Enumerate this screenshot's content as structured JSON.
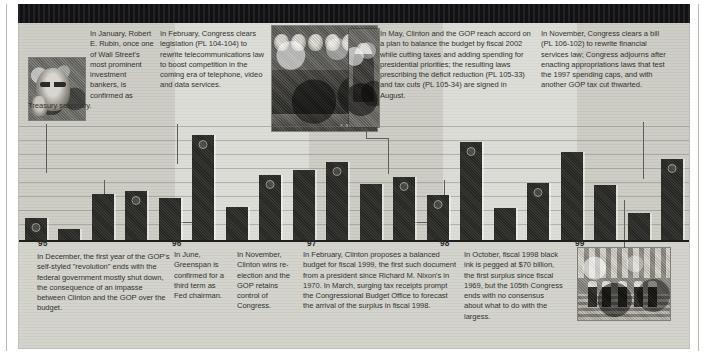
{
  "meta": {
    "accent_dark": "#2a2a27",
    "paper": "#cdcdc6",
    "ink": "#33332f"
  },
  "photos": {
    "rubin": {
      "name": "robert-rubin-portrait"
    },
    "signing": {
      "name": "congress-bill-signing-photo",
      "credit": "R. Michael Jenkins"
    },
    "clinton": {
      "name": "clinton-at-desk-photo"
    },
    "steps": {
      "name": "capitol-steps-crowd-photo"
    }
  },
  "top_callouts": [
    {
      "id": "jan-1995-rubin",
      "text": "In January, Robert E. Rubin, once one of Wall Street's most prominent investment bankers, is confirmed as Treasury secretary."
    },
    {
      "id": "feb-1996-telecom",
      "text": "In February, Congress clears legislation (PL 104-104) to rewrite telecommunications law to boost competition in the coming era of telephone, video and data services."
    },
    {
      "id": "may-1997-balanced-budget",
      "text": "In May, Clinton and the GOP reach accord on a plan to balance the budget by fiscal 2002 while cutting taxes and adding spending for presidential priorities; the resulting laws prescribing the deficit reduction (PL 105-33) and tax cuts (PL 105-34) are signed in August."
    },
    {
      "id": "nov-1999-financial-services",
      "text": "In November, Congress clears a bill (PL 106-102) to rewrite financial services law; Congress adjourns after enacting appropriations laws that test the 1997 spending caps, and with another GOP tax cut thwarted."
    }
  ],
  "bottom_callouts": [
    {
      "id": "dec-1995-shutdown",
      "text": "In December, the first year of the GOP's self-styled \"revolution\" ends with the federal government mostly shut down, the consequence of an impasse between Clinton and the GOP over the budget."
    },
    {
      "id": "jun-1996-greenspan",
      "text": "In June, Greenspan is confirmed for a third term as Fed chairman."
    },
    {
      "id": "nov-1996-reelection",
      "text": "In November, Clinton wins re-election and the GOP retains control of Congress."
    },
    {
      "id": "feb-1998-balanced-budget-proposal",
      "text": "In February, Clinton proposes a balanced budget for fiscal 1999, the first such document from a president since Richard M. Nixon's in 1970. In March, surging tax receipts prompt the Congressional Budget Office to forecast the arrival of the surplus in fiscal 1998."
    },
    {
      "id": "oct-1998-surplus",
      "text": "In October, fiscal 1998 black ink is pegged at $70 billion, the first surplus since fiscal 1969, but the 105th Congress ends with no consensus about what to do with the largess."
    }
  ],
  "chart_data": {
    "type": "bar",
    "title": "",
    "xlabel": "",
    "ylabel": "",
    "grid": true,
    "legend": false,
    "categories": [
      "'95 Q1",
      "'95 Q2",
      "'95 Q3",
      "'95 Q4",
      "'96 Q1",
      "'96 Q2",
      "'96 Q3",
      "'96 Q4",
      "'97 Q1",
      "'97 Q2",
      "'97 Q3",
      "'97 Q4",
      "'98 Q1",
      "'98 Q2",
      "'98 Q3",
      "'98 Q4",
      "'99 Q1",
      "'99 Q2",
      "'99 Q3",
      "'99 Q4"
    ],
    "values": [
      18,
      9,
      38,
      40,
      34,
      86,
      27,
      53,
      57,
      64,
      46,
      52,
      37,
      80,
      26,
      47,
      72,
      45,
      22,
      66
    ],
    "marked_bars": [
      0,
      3,
      5,
      7,
      9,
      11,
      12,
      13,
      15,
      19
    ],
    "ylim": [
      0,
      95
    ],
    "tick_years": [
      "'95",
      "'96",
      "'97",
      "'98",
      "'99"
    ]
  }
}
